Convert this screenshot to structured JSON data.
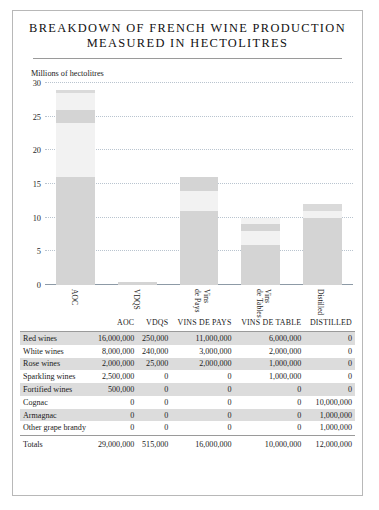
{
  "title": {
    "line1": "BREAKDOWN OF FRENCH WINE PRODUCTION",
    "line2": "MEASURED IN HECTOLITRES"
  },
  "chart_data": {
    "type": "bar",
    "stacked": true,
    "title": "BREAKDOWN OF FRENCH WINE PRODUCTION MEASURED IN HECTOLITRES",
    "ylabel": "Millions of hectolitres",
    "xlabel": "",
    "ylim": [
      0,
      30
    ],
    "yticks": [
      0,
      5,
      10,
      15,
      20,
      25,
      30
    ],
    "grid": true,
    "legend": "none",
    "units": "millions of hectolitres",
    "categories": [
      "AOC",
      "VDQS",
      "Vins de Pays",
      "Vins de Tables",
      "Distilled"
    ],
    "series": [
      {
        "name": "Red wines",
        "values": [
          16.0,
          0.25,
          11.0,
          6.0,
          0.0
        ]
      },
      {
        "name": "White wines",
        "values": [
          8.0,
          0.24,
          3.0,
          2.0,
          0.0
        ]
      },
      {
        "name": "Rose wines",
        "values": [
          2.0,
          0.025,
          2.0,
          1.0,
          0.0
        ]
      },
      {
        "name": "Sparkling wines",
        "values": [
          2.5,
          0.0,
          0.0,
          1.0,
          0.0
        ]
      },
      {
        "name": "Fortified wines",
        "values": [
          0.5,
          0.0,
          0.0,
          0.0,
          0.0
        ]
      },
      {
        "name": "Cognac",
        "values": [
          0.0,
          0.0,
          0.0,
          0.0,
          10.0
        ]
      },
      {
        "name": "Armagnac",
        "values": [
          0.0,
          0.0,
          0.0,
          0.0,
          1.0
        ]
      },
      {
        "name": "Other grape brandy",
        "values": [
          0.0,
          0.0,
          0.0,
          0.0,
          1.0
        ]
      }
    ],
    "totals": [
      29.0,
      0.515,
      16.0,
      10.0,
      12.0
    ]
  },
  "colors": {
    "seg_dark": "#d4d4d4",
    "seg_light": "#f2f2f2",
    "seg_mid": "#dadada",
    "grid": "#b9c4cf",
    "axis": "#8d9aa6",
    "row_shade": "#dcdcdc",
    "border": "#b8b8b8"
  },
  "table": {
    "columns": [
      "",
      "AOC",
      "VDQS",
      "VINS DE PAYS",
      "VINS DE TABLE",
      "DISTILLED"
    ],
    "rows": [
      {
        "label": "Red wines",
        "cells": [
          "16,000,000",
          "250,000",
          "11,000,000",
          "6,000,000",
          "0"
        ]
      },
      {
        "label": "White wines",
        "cells": [
          "8,000,000",
          "240,000",
          "3,000,000",
          "2,000,000",
          "0"
        ]
      },
      {
        "label": "Rose wines",
        "cells": [
          "2,000,000",
          "25,000",
          "2,000,000",
          "1,000,000",
          "0"
        ]
      },
      {
        "label": "Sparkling wines",
        "cells": [
          "2,500,000",
          "0",
          "0",
          "1,000,000",
          "0"
        ]
      },
      {
        "label": "Fortified wines",
        "cells": [
          "500,000",
          "0",
          "0",
          "0",
          "0"
        ]
      },
      {
        "label": "Cognac",
        "cells": [
          "0",
          "0",
          "0",
          "0",
          "10,000,000"
        ]
      },
      {
        "label": "Armagnac",
        "cells": [
          "0",
          "0",
          "0",
          "0",
          "1,000,000"
        ]
      },
      {
        "label": "Other grape brandy",
        "cells": [
          "0",
          "0",
          "0",
          "0",
          "1,000,000"
        ]
      }
    ],
    "totals": {
      "label": "Totals",
      "cells": [
        "29,000,000",
        "515,000",
        "16,000,000",
        "10,000,000",
        "12,000,000"
      ]
    }
  }
}
